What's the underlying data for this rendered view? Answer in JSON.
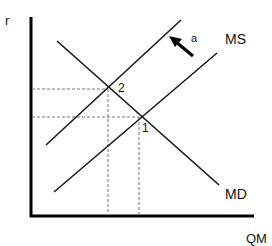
{
  "diagram": {
    "type": "money-market-supply-demand",
    "axes": {
      "y_label": "r",
      "x_label": "QM"
    },
    "curves": {
      "demand": {
        "label": "MD"
      },
      "supply_original": {
        "label": "MS"
      },
      "supply_shifted": {
        "label": ""
      }
    },
    "shift_arrow": {
      "label": "a",
      "direction": "up-left"
    },
    "equilibria": [
      {
        "label": "1"
      },
      {
        "label": "2"
      }
    ],
    "colors": {
      "line": "#1a1a1a",
      "guide": "#777777",
      "background": "#ffffff"
    }
  }
}
